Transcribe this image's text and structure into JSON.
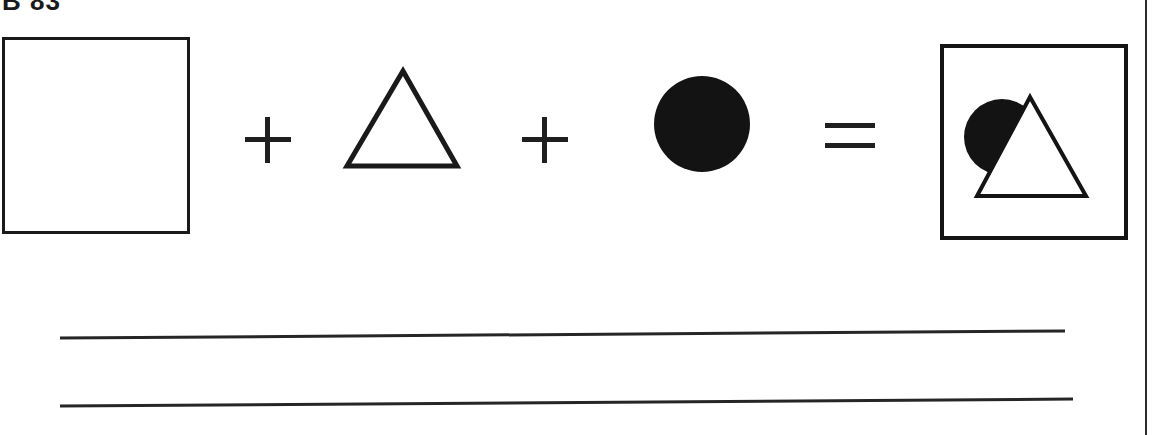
{
  "page": {
    "header_label": "B 83",
    "background_color": "#ffffff",
    "ink_color": "#1a1a1a",
    "width": 1165,
    "height": 435
  },
  "equation": {
    "description": "Shape composition equation: square plus triangle plus circle equals combined figure",
    "operands": [
      {
        "index": 0,
        "shape": "square",
        "fill": "none",
        "stroke": "#1a1a1a",
        "label": "empty square"
      },
      {
        "index": 1,
        "shape": "triangle",
        "fill": "none",
        "stroke": "#1a1a1a",
        "label": "outlined triangle"
      },
      {
        "index": 2,
        "shape": "circle",
        "fill": "#131313",
        "stroke": "none",
        "label": "filled black circle"
      }
    ],
    "operators": [
      {
        "index": 0,
        "symbol": "+",
        "name": "plus"
      },
      {
        "index": 1,
        "symbol": "+",
        "name": "plus"
      },
      {
        "index": 2,
        "symbol": "=",
        "name": "equals"
      }
    ],
    "result": {
      "label": "composition result",
      "frame": "square frame",
      "contents": [
        {
          "shape": "circle",
          "fill": "#131313",
          "z": 1
        },
        {
          "shape": "triangle",
          "fill": "#ffffff",
          "stroke": "#141414",
          "z": 2
        }
      ]
    }
  },
  "answer_area": {
    "line_count": 2,
    "lines": [
      {
        "index": 0,
        "label": "answer-line-1"
      },
      {
        "index": 1,
        "label": "answer-line-2"
      }
    ]
  },
  "page_rules": {
    "right_edge": "vertical page border rule"
  }
}
